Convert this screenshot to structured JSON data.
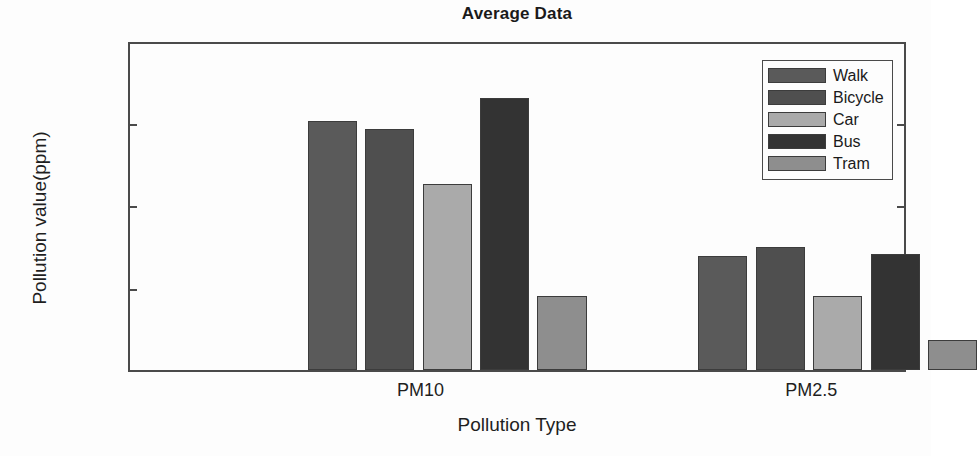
{
  "chart_data": {
    "type": "bar",
    "title": "Average Data",
    "xlabel": "Pollution Type",
    "ylabel": "Pollution value(ppm)",
    "categories": [
      "PM10",
      "PM2.5"
    ],
    "ylim": [
      0,
      0.02
    ],
    "ytick_labels": [
      "0",
      "0.005",
      "0.01",
      "0.015",
      "0.02"
    ],
    "ytick_values": [
      0,
      0.005,
      0.01,
      0.015,
      0.02
    ],
    "grid": false,
    "legend_position": "top-right",
    "series": [
      {
        "name": "Walk",
        "color": "#5a5a5a",
        "values": [
          0.0151,
          0.0069
        ]
      },
      {
        "name": "Bicycle",
        "color": "#4f4f4f",
        "values": [
          0.0146,
          0.00743
        ]
      },
      {
        "name": "Car",
        "color": "#aaaaaa",
        "values": [
          0.0113,
          0.00447
        ]
      },
      {
        "name": "Bus",
        "color": "#333333",
        "values": [
          0.01648,
          0.00705
        ]
      },
      {
        "name": "Tram",
        "color": "#8e8e8e",
        "values": [
          0.0045,
          0.0018
        ]
      }
    ]
  }
}
